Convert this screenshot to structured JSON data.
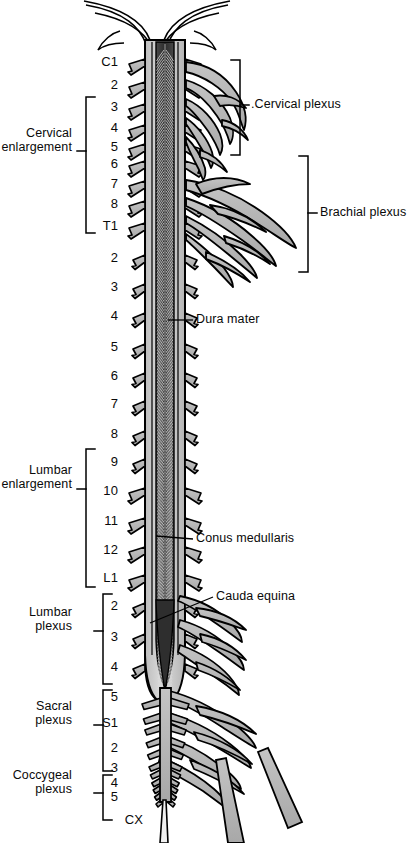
{
  "figure": {
    "type": "anatomical-diagram",
    "view": "posterior view of spinal cord with dura opened",
    "colors": {
      "outline": "#000000",
      "dura": "#c9c9c9",
      "cord_gray_matter": "#3a3a3a",
      "nerve_fill": "#b8b8b8",
      "background": "#ffffff",
      "text": "#0a0a0a"
    }
  },
  "segment_labels": [
    {
      "text": "C1",
      "x": 118,
      "y": 62,
      "region": "cervical"
    },
    {
      "text": "2",
      "x": 118,
      "y": 85,
      "region": "cervical"
    },
    {
      "text": "3",
      "x": 118,
      "y": 107,
      "region": "cervical"
    },
    {
      "text": "4",
      "x": 118,
      "y": 128,
      "region": "cervical"
    },
    {
      "text": "5",
      "x": 118,
      "y": 147,
      "region": "cervical"
    },
    {
      "text": "6",
      "x": 118,
      "y": 164,
      "region": "cervical"
    },
    {
      "text": "7",
      "x": 118,
      "y": 184,
      "region": "cervical"
    },
    {
      "text": "8",
      "x": 118,
      "y": 204,
      "region": "cervical"
    },
    {
      "text": "T1",
      "x": 118,
      "y": 226,
      "region": "thoracic"
    },
    {
      "text": "2",
      "x": 118,
      "y": 258,
      "region": "thoracic"
    },
    {
      "text": "3",
      "x": 118,
      "y": 287,
      "region": "thoracic"
    },
    {
      "text": "4",
      "x": 118,
      "y": 316,
      "region": "thoracic"
    },
    {
      "text": "5",
      "x": 118,
      "y": 347,
      "region": "thoracic"
    },
    {
      "text": "6",
      "x": 118,
      "y": 376,
      "region": "thoracic"
    },
    {
      "text": "7",
      "x": 118,
      "y": 404,
      "region": "thoracic"
    },
    {
      "text": "8",
      "x": 118,
      "y": 434,
      "region": "thoracic"
    },
    {
      "text": "9",
      "x": 118,
      "y": 462,
      "region": "thoracic"
    },
    {
      "text": "10",
      "x": 118,
      "y": 491,
      "region": "thoracic"
    },
    {
      "text": "11",
      "x": 118,
      "y": 521,
      "region": "thoracic"
    },
    {
      "text": "12",
      "x": 118,
      "y": 550,
      "region": "thoracic"
    },
    {
      "text": "L1",
      "x": 118,
      "y": 578,
      "region": "lumbar"
    },
    {
      "text": "2",
      "x": 118,
      "y": 606,
      "region": "lumbar"
    },
    {
      "text": "3",
      "x": 118,
      "y": 637,
      "region": "lumbar"
    },
    {
      "text": "4",
      "x": 118,
      "y": 667,
      "region": "lumbar"
    },
    {
      "text": "5",
      "x": 118,
      "y": 697,
      "region": "lumbar"
    },
    {
      "text": "S1",
      "x": 118,
      "y": 723,
      "region": "sacral"
    },
    {
      "text": "2",
      "x": 118,
      "y": 748,
      "region": "sacral"
    },
    {
      "text": "3",
      "x": 118,
      "y": 768,
      "region": "sacral"
    },
    {
      "text": "4",
      "x": 118,
      "y": 783,
      "region": "sacral"
    },
    {
      "text": "5",
      "x": 118,
      "y": 797,
      "region": "sacral"
    },
    {
      "text": "CX",
      "x": 143,
      "y": 820,
      "region": "coccygeal"
    }
  ],
  "left_brackets": [
    {
      "name": "cervical-enlargement",
      "line1": "Cervical",
      "line2": "enlargement",
      "text_x": 72,
      "text_y": 141,
      "bar_x": 86,
      "top": 97,
      "bottom": 233,
      "tick_y": 151
    },
    {
      "name": "lumbar-enlargement",
      "line1": "Lumbar",
      "line2": "enlargement",
      "text_x": 72,
      "text_y": 478,
      "bar_x": 86,
      "top": 449,
      "bottom": 587,
      "tick_y": 489
    },
    {
      "name": "lumbar-plexus",
      "line1": "Lumbar",
      "line2": "plexus",
      "text_x": 72,
      "text_y": 620,
      "bar_x": 103,
      "top": 594,
      "bottom": 684,
      "tick_y": 631
    },
    {
      "name": "sacral-plexus",
      "line1": "Sacral",
      "line2": "plexus",
      "text_x": 72,
      "text_y": 714,
      "bar_x": 103,
      "top": 690,
      "bottom": 771,
      "tick_y": 725
    },
    {
      "name": "coccygeal-plexus",
      "line1": "Coccygeal",
      "line2": "plexus",
      "text_x": 72,
      "text_y": 783,
      "bar_x": 103,
      "top": 775,
      "bottom": 820,
      "tick_y": 793
    }
  ],
  "right_brackets": [
    {
      "name": "cervical-plexus",
      "label": ".Cervical plexus",
      "text_x": 251,
      "text_y": 105,
      "bar_x": 240,
      "top": 60,
      "bottom": 155,
      "tick_y": 105
    },
    {
      "name": "brachial-plexus",
      "label": "Brachial plexus",
      "text_x": 320,
      "text_y": 213,
      "bar_x": 308,
      "top": 156,
      "bottom": 272,
      "tick_y": 213
    }
  ],
  "leader_labels": [
    {
      "name": "dura-mater",
      "label": "Dura mater",
      "text_x": 196,
      "text_y": 320,
      "line": [
        [
          193,
          320
        ],
        [
          168,
          320
        ]
      ]
    },
    {
      "name": "conus-medullaris",
      "label": "Conus medullaris",
      "text_x": 196,
      "text_y": 539,
      "line": [
        [
          193,
          539
        ],
        [
          156,
          536
        ]
      ]
    },
    {
      "name": "cauda-equina",
      "label": "Cauda equina",
      "text_x": 216,
      "text_y": 597,
      "line": [
        [
          213,
          597
        ],
        [
          150,
          623
        ]
      ]
    }
  ]
}
